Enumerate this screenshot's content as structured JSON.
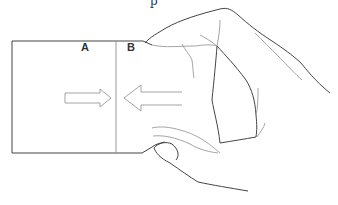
{
  "figure": {
    "labels": {
      "left_half": "A",
      "right_half": "B"
    },
    "top_cropped_text": "p",
    "arrows": [
      {
        "direction": "right",
        "position": "half A"
      },
      {
        "direction": "left",
        "position": "half B"
      }
    ],
    "colors": {
      "outline": "#444444",
      "light_line": "#9a9a9a",
      "background": "#ffffff"
    }
  }
}
